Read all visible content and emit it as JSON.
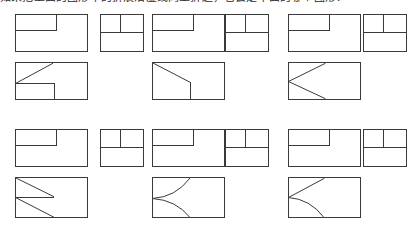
{
  "page": {
    "caption": "如果把上面的图形中的折痕沿虚线向上折起，它会是下面的哪个图形？",
    "caption_clipped": true,
    "background_color": "#ffffff",
    "line_color": "#3a3a3a",
    "width": 410,
    "height": 227
  },
  "figures": {
    "rows": [
      {
        "row_name": "row-1-folded-results",
        "items": [
          {
            "name": "fig-r1c1-large",
            "shape": "rectangle-with-notch",
            "x": 15,
            "y": 14,
            "w": 72,
            "h": 37,
            "lines": [
              {
                "type": "line",
                "id": "vertical-partial-top",
                "x1": 41,
                "y1": 0,
                "x2": 41,
                "y2": 16
              },
              {
                "type": "line",
                "id": "horizontal-left-segment",
                "x1": 0,
                "y1": 16,
                "x2": 41,
                "y2": 16
              }
            ]
          },
          {
            "name": "fig-r1c2-small",
            "shape": "rectangle-split-three",
            "x": 100,
            "y": 14,
            "w": 43,
            "h": 37,
            "lines": [
              {
                "type": "line",
                "id": "horizontal-midline",
                "x1": 0,
                "y1": 18,
                "x2": 43,
                "y2": 18
              },
              {
                "type": "line",
                "id": "vertical-upper-half",
                "x1": 20,
                "y1": 0,
                "x2": 20,
                "y2": 18
              }
            ]
          },
          {
            "name": "fig-r1c3-large",
            "shape": "rectangle-with-notch",
            "x": 152,
            "y": 14,
            "w": 72,
            "h": 37,
            "lines": [
              {
                "type": "line",
                "id": "vertical-partial-top",
                "x1": 41,
                "y1": 0,
                "x2": 41,
                "y2": 16
              },
              {
                "type": "line",
                "id": "horizontal-left-segment",
                "x1": 0,
                "y1": 16,
                "x2": 41,
                "y2": 16
              }
            ]
          },
          {
            "name": "fig-r1c4-small",
            "shape": "rectangle-split-three",
            "x": 225,
            "y": 14,
            "w": 43,
            "h": 37,
            "lines": [
              {
                "type": "line",
                "id": "horizontal-midline",
                "x1": 0,
                "y1": 18,
                "x2": 43,
                "y2": 18
              },
              {
                "type": "line",
                "id": "vertical-upper-half",
                "x1": 20,
                "y1": 0,
                "x2": 20,
                "y2": 18
              }
            ]
          },
          {
            "name": "fig-r1c5-large",
            "shape": "rectangle-with-notch",
            "x": 288,
            "y": 14,
            "w": 72,
            "h": 37,
            "lines": [
              {
                "type": "line",
                "id": "vertical-partial-top",
                "x1": 41,
                "y1": 0,
                "x2": 41,
                "y2": 16
              },
              {
                "type": "line",
                "id": "horizontal-left-segment",
                "x1": 0,
                "y1": 16,
                "x2": 41,
                "y2": 16
              }
            ]
          },
          {
            "name": "fig-r1c6-small",
            "shape": "rectangle-split-three",
            "x": 363,
            "y": 14,
            "w": 43,
            "h": 37,
            "lines": [
              {
                "type": "line",
                "id": "horizontal-midline",
                "x1": 0,
                "y1": 18,
                "x2": 43,
                "y2": 18
              },
              {
                "type": "line",
                "id": "vertical-upper-half",
                "x1": 20,
                "y1": 0,
                "x2": 20,
                "y2": 18
              }
            ]
          }
        ]
      },
      {
        "row_name": "row-2-source-figures",
        "items": [
          {
            "name": "fig-r2c1-large",
            "shape": "rectangle-diagonal-step",
            "x": 15,
            "y": 62,
            "w": 72,
            "h": 37,
            "lines": [
              {
                "type": "line",
                "id": "diagonal-up-right",
                "x1": 0,
                "y1": 21,
                "x2": 37,
                "y2": 2
              },
              {
                "type": "line",
                "id": "horizontal-left-segment",
                "x1": 0,
                "y1": 21,
                "x2": 39,
                "y2": 21
              },
              {
                "type": "line",
                "id": "vertical-to-bottom",
                "x1": 39,
                "y1": 21,
                "x2": 39,
                "y2": 37
              }
            ]
          },
          {
            "name": "fig-r2c2-large",
            "shape": "rectangle-diagonal-corner",
            "x": 152,
            "y": 62,
            "w": 72,
            "h": 37,
            "lines": [
              {
                "type": "line",
                "id": "diagonal-down-right",
                "x1": 1,
                "y1": 1,
                "x2": 38,
                "y2": 20
              },
              {
                "type": "line",
                "id": "vertical-to-bottom",
                "x1": 38,
                "y1": 20,
                "x2": 38,
                "y2": 37
              }
            ]
          },
          {
            "name": "fig-r2c3-large",
            "shape": "rectangle-chevron-left",
            "x": 288,
            "y": 62,
            "w": 72,
            "h": 37,
            "lines": [
              {
                "type": "line",
                "id": "chevron-upper-arm",
                "x1": 0,
                "y1": 19,
                "x2": 37,
                "y2": 1
              },
              {
                "type": "line",
                "id": "chevron-lower-arm",
                "x1": 0,
                "y1": 19,
                "x2": 37,
                "y2": 36
              }
            ]
          }
        ]
      },
      {
        "row_name": "row-3-folded-results",
        "items": [
          {
            "name": "fig-r3c1-large",
            "shape": "rectangle-with-notch",
            "x": 15,
            "y": 129,
            "w": 72,
            "h": 37,
            "lines": [
              {
                "type": "line",
                "id": "vertical-partial-top",
                "x1": 41,
                "y1": 0,
                "x2": 41,
                "y2": 16
              },
              {
                "type": "line",
                "id": "horizontal-left-segment",
                "x1": 0,
                "y1": 16,
                "x2": 41,
                "y2": 16
              }
            ]
          },
          {
            "name": "fig-r3c2-small",
            "shape": "rectangle-split-three",
            "x": 100,
            "y": 129,
            "w": 43,
            "h": 37,
            "lines": [
              {
                "type": "line",
                "id": "horizontal-midline",
                "x1": 0,
                "y1": 18,
                "x2": 43,
                "y2": 18
              },
              {
                "type": "line",
                "id": "vertical-upper-half",
                "x1": 20,
                "y1": 0,
                "x2": 20,
                "y2": 18
              }
            ]
          },
          {
            "name": "fig-r3c3-large",
            "shape": "rectangle-with-notch",
            "x": 152,
            "y": 129,
            "w": 72,
            "h": 37,
            "lines": [
              {
                "type": "line",
                "id": "vertical-partial-top",
                "x1": 41,
                "y1": 0,
                "x2": 41,
                "y2": 16
              },
              {
                "type": "line",
                "id": "horizontal-left-segment",
                "x1": 0,
                "y1": 16,
                "x2": 41,
                "y2": 16
              }
            ]
          },
          {
            "name": "fig-r3c4-small",
            "shape": "rectangle-split-three",
            "x": 225,
            "y": 129,
            "w": 43,
            "h": 37,
            "lines": [
              {
                "type": "line",
                "id": "horizontal-midline",
                "x1": 0,
                "y1": 18,
                "x2": 43,
                "y2": 18
              },
              {
                "type": "line",
                "id": "vertical-upper-half",
                "x1": 20,
                "y1": 0,
                "x2": 20,
                "y2": 18
              }
            ]
          },
          {
            "name": "fig-r3c5-large",
            "shape": "rectangle-with-notch",
            "x": 288,
            "y": 129,
            "w": 72,
            "h": 37,
            "lines": [
              {
                "type": "line",
                "id": "vertical-partial-top",
                "x1": 41,
                "y1": 0,
                "x2": 41,
                "y2": 16
              },
              {
                "type": "line",
                "id": "horizontal-left-segment",
                "x1": 0,
                "y1": 16,
                "x2": 41,
                "y2": 16
              }
            ]
          },
          {
            "name": "fig-r3c6-small",
            "shape": "rectangle-split-three",
            "x": 363,
            "y": 129,
            "w": 43,
            "h": 37,
            "lines": [
              {
                "type": "line",
                "id": "horizontal-midline",
                "x1": 0,
                "y1": 18,
                "x2": 43,
                "y2": 18
              },
              {
                "type": "line",
                "id": "vertical-upper-half",
                "x1": 20,
                "y1": 0,
                "x2": 20,
                "y2": 18
              }
            ]
          }
        ]
      },
      {
        "row_name": "row-4-source-figures",
        "items": [
          {
            "name": "fig-r4c1-large",
            "shape": "rectangle-zigzag",
            "x": 15,
            "y": 177,
            "w": 72,
            "h": 40,
            "lines": [
              {
                "type": "line",
                "id": "diagonal-upper",
                "x1": 1,
                "y1": 1,
                "x2": 38,
                "y2": 19
              },
              {
                "type": "line",
                "id": "horizontal-mid",
                "x1": 0,
                "y1": 20,
                "x2": 38,
                "y2": 20
              },
              {
                "type": "line",
                "id": "diagonal-lower",
                "x1": 0,
                "y1": 20,
                "x2": 38,
                "y2": 39
              }
            ]
          },
          {
            "name": "fig-r4c2-large",
            "shape": "rectangle-curved-chevron",
            "x": 152,
            "y": 177,
            "w": 72,
            "h": 40,
            "lines": [
              {
                "type": "arc",
                "id": "arc-upper",
                "x1": 0,
                "y1": 21,
                "x2": 38,
                "y2": 1,
                "cx": 22,
                "cy": 20,
                "concave": "left"
              },
              {
                "type": "arc",
                "id": "arc-lower",
                "x1": 0,
                "y1": 21,
                "x2": 38,
                "y2": 40,
                "cx": 22,
                "cy": 22,
                "concave": "left"
              }
            ]
          },
          {
            "name": "fig-r4c3-large",
            "shape": "rectangle-mixed-chevron",
            "x": 288,
            "y": 177,
            "w": 72,
            "h": 40,
            "lines": [
              {
                "type": "line",
                "id": "diagonal-upper-arm",
                "x1": 0,
                "y1": 20,
                "x2": 36,
                "y2": 1
              },
              {
                "type": "arc",
                "id": "arc-lower-arm",
                "x1": 0,
                "y1": 20,
                "x2": 36,
                "y2": 40,
                "cx": 20,
                "cy": 22,
                "concave": "left"
              }
            ]
          }
        ]
      }
    ]
  }
}
